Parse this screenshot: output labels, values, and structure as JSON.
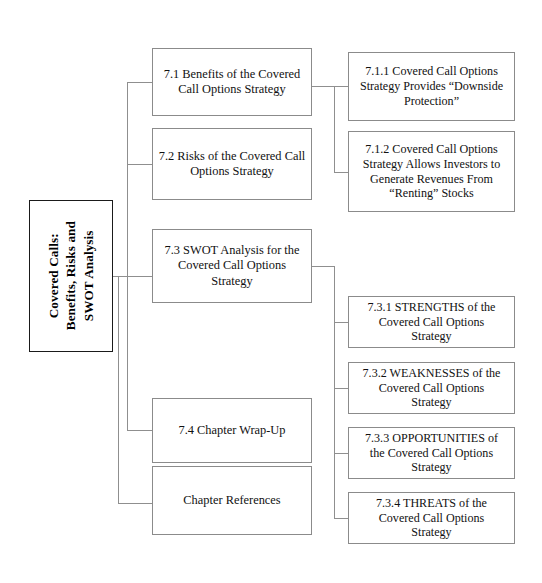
{
  "diagram": {
    "type": "organizational-tree",
    "root": {
      "id": "root",
      "label": "Covered Calls:\nBenefits, Risks and\nSWOT Analysis",
      "orientation": "vertical-text",
      "bold": true
    },
    "level1": [
      {
        "id": "7.1",
        "label": "7.1 Benefits of the Covered\nCall Options Strategy"
      },
      {
        "id": "7.2",
        "label": "7.2 Risks of the Covered Call\nOptions Strategy"
      },
      {
        "id": "7.3",
        "label": "7.3 SWOT Analysis for the\nCovered Call  Options\nStrategy"
      },
      {
        "id": "7.4",
        "label": "7.4 Chapter Wrap-Up"
      },
      {
        "id": "refs",
        "label": "Chapter References"
      }
    ],
    "level2": [
      {
        "id": "7.1.1",
        "parent": "7.1",
        "label": "7.1.1 Covered Call Options\nStrategy Provides “Downside\nProtection”"
      },
      {
        "id": "7.1.2",
        "parent": "7.1",
        "label": "7.1.2 Covered Call Options\nStrategy Allows Investors to\nGenerate Revenues From\n“Renting” Stocks"
      },
      {
        "id": "7.3.1",
        "parent": "7.3",
        "label": "7.3.1 STRENGTHS of the\nCovered Call Options\nStrategy"
      },
      {
        "id": "7.3.2",
        "parent": "7.3",
        "label": "7.3.2 WEAKNESSES of the\nCovered Call Options\nStrategy"
      },
      {
        "id": "7.3.3",
        "parent": "7.3",
        "label": "7.3.3 OPPORTUNITIES of\nthe Covered Call Options\nStrategy"
      },
      {
        "id": "7.3.4",
        "parent": "7.3",
        "label": "7.3.4 THREATS of the\nCovered Call   Options\nStrategy"
      }
    ],
    "colors": {
      "background": "#ffffff",
      "box_border": "#8b8b8b",
      "root_border": "#1a1a1a",
      "connector": "#8f8f8f",
      "text": "#111111"
    }
  }
}
